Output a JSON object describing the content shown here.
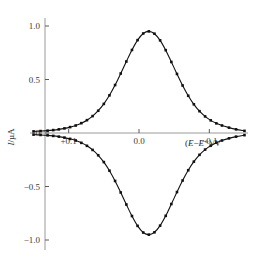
{
  "figure": {
    "background": "#ffffff",
    "width": 254,
    "height": 266
  },
  "axes": {
    "y_title": "I/µA",
    "y_title_italic_part": "I",
    "x_title_prefix": "(",
    "x_title_e1": "E",
    "x_title_minus": "−",
    "x_title_e2": "E",
    "x_title_standard_symbol": "⦵",
    "x_title_suffix": ")/V",
    "y_ticks": [
      "1.0",
      "0.5",
      "0",
      "−0.5",
      "−1.0"
    ],
    "y_tick_values": [
      1.0,
      0.5,
      0.0,
      -0.5,
      -1.0
    ],
    "x_ticks": [
      "+0.1",
      "0.0",
      "−0.1"
    ],
    "x_tick_values": [
      0.1,
      0.0,
      -0.1
    ],
    "x_minor_tick_values": [
      0.05,
      -0.05
    ],
    "axis_color": "#9a9a9a",
    "tick_color": "#5a5a5a",
    "curve_color": "#111111"
  },
  "chart_data": {
    "type": "line",
    "title": "",
    "subtitle": "",
    "xlabel": "(E−E⦵)/V",
    "ylabel": "I/µA",
    "xlim": [
      0.155,
      -0.155
    ],
    "ylim": [
      -1.18,
      1.12
    ],
    "x_axis_reversed": true,
    "grid": false,
    "legend": null,
    "marker": "square",
    "annotations": [],
    "series": [
      {
        "name": "anodic-peak",
        "marker": "square",
        "color": "#111111",
        "x": [
          0.15,
          0.14,
          0.13,
          0.122,
          0.114,
          0.106,
          0.098,
          0.09,
          0.082,
          0.074,
          0.066,
          0.058,
          0.05,
          0.042,
          0.034,
          0.026,
          0.018,
          0.01,
          0.002,
          -0.006,
          -0.014,
          -0.022,
          -0.03,
          -0.038,
          -0.046,
          -0.054,
          -0.062,
          -0.07,
          -0.078,
          -0.086,
          -0.094,
          -0.102,
          -0.11,
          -0.118,
          -0.128,
          -0.138,
          -0.15
        ],
        "y": [
          0.015,
          0.018,
          0.022,
          0.027,
          0.034,
          0.043,
          0.055,
          0.07,
          0.092,
          0.12,
          0.158,
          0.208,
          0.272,
          0.352,
          0.448,
          0.556,
          0.668,
          0.776,
          0.868,
          0.93,
          0.95,
          0.928,
          0.866,
          0.774,
          0.664,
          0.552,
          0.444,
          0.348,
          0.268,
          0.204,
          0.155,
          0.118,
          0.09,
          0.07,
          0.05,
          0.034,
          0.02
        ]
      },
      {
        "name": "cathodic-peak",
        "marker": "square",
        "color": "#111111",
        "x": [
          0.15,
          0.14,
          0.13,
          0.122,
          0.114,
          0.106,
          0.098,
          0.09,
          0.082,
          0.074,
          0.066,
          0.058,
          0.05,
          0.042,
          0.034,
          0.026,
          0.018,
          0.01,
          0.002,
          -0.006,
          -0.014,
          -0.022,
          -0.03,
          -0.038,
          -0.046,
          -0.054,
          -0.062,
          -0.07,
          -0.078,
          -0.086,
          -0.094,
          -0.102,
          -0.11,
          -0.118,
          -0.128,
          -0.138,
          -0.15
        ],
        "y": [
          -0.015,
          -0.018,
          -0.022,
          -0.027,
          -0.034,
          -0.043,
          -0.055,
          -0.07,
          -0.092,
          -0.12,
          -0.158,
          -0.208,
          -0.272,
          -0.352,
          -0.448,
          -0.556,
          -0.668,
          -0.776,
          -0.868,
          -0.93,
          -0.95,
          -0.928,
          -0.866,
          -0.774,
          -0.664,
          -0.552,
          -0.444,
          -0.348,
          -0.268,
          -0.204,
          -0.155,
          -0.118,
          -0.09,
          -0.07,
          -0.05,
          -0.034,
          -0.02
        ]
      }
    ]
  }
}
